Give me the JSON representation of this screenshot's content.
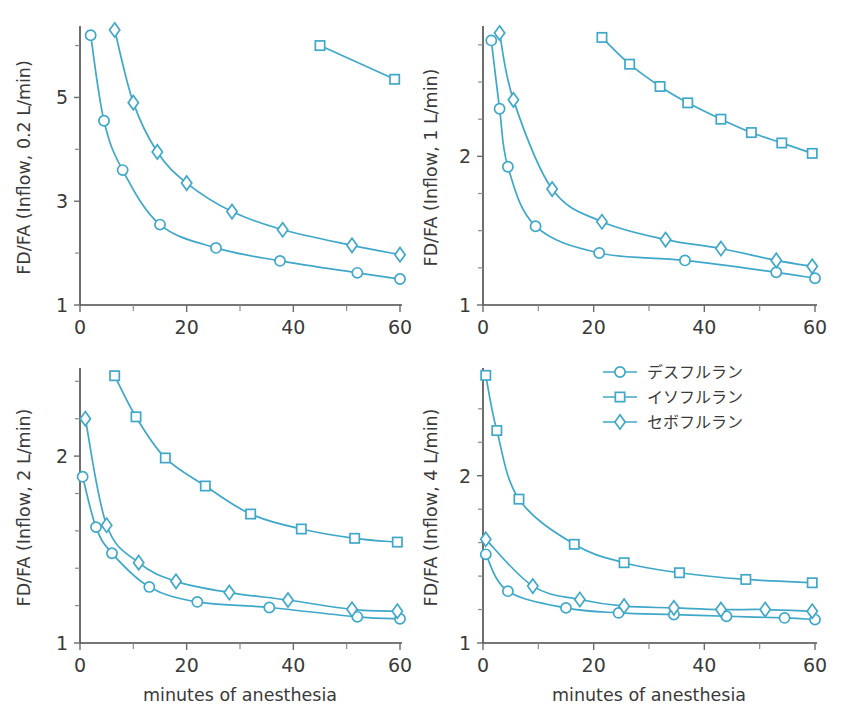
{
  "figure": {
    "accent_color": "#3fa8c9",
    "axis_color": "#4a4a4a",
    "xlabel": "minutes of anesthesia",
    "marker_shapes": {
      "desflurane": "circle",
      "isoflurane": "square",
      "sevoflurane": "diamond"
    }
  },
  "legend": {
    "position": "top-right of bottom-right panel",
    "entries": [
      {
        "label": "デスフルラン",
        "marker": "circle"
      },
      {
        "label": "イソフルラン",
        "marker": "square"
      },
      {
        "label": "セボフルラン",
        "marker": "diamond"
      }
    ]
  },
  "chart_data": [
    {
      "id": "panel-top-left",
      "type": "line",
      "title": "",
      "ylabel": "FD/FA  (Inflow, 0.2 L/min)",
      "xlabel": "",
      "xlim": [
        0,
        60
      ],
      "ylim": [
        1,
        6.3
      ],
      "xticks": [
        0,
        20,
        40,
        60
      ],
      "xticklabels": [
        "0",
        "20",
        "40",
        "60"
      ],
      "xminorticks": [
        10,
        30,
        50
      ],
      "yticks": [
        1,
        3,
        5
      ],
      "yticklabels": [
        "1",
        "3",
        "5"
      ],
      "yminorticks": [
        2,
        4,
        6
      ],
      "grid": false,
      "series": [
        {
          "name": "デスフルラン",
          "marker": "circle",
          "x": [
            2,
            4.5,
            8,
            15,
            25.5,
            37.5,
            52,
            60
          ],
          "y": [
            6.2,
            4.55,
            3.6,
            2.55,
            2.1,
            1.85,
            1.62,
            1.5
          ]
        },
        {
          "name": "イソフルラン",
          "marker": "square",
          "x": [
            45,
            59
          ],
          "y": [
            6.0,
            5.35
          ]
        },
        {
          "name": "セボフルラン",
          "marker": "diamond",
          "x": [
            6.5,
            10,
            14.5,
            20,
            28.5,
            38,
            51,
            60
          ],
          "y": [
            6.3,
            4.9,
            3.95,
            3.35,
            2.8,
            2.45,
            2.15,
            1.97
          ]
        }
      ]
    },
    {
      "id": "panel-top-right",
      "type": "line",
      "title": "",
      "ylabel": "FD/FA  (Inflow, 1 L/min)",
      "xlabel": "",
      "xlim": [
        0,
        60
      ],
      "ylim": [
        1,
        2.85
      ],
      "xticks": [
        0,
        20,
        40,
        60
      ],
      "xticklabels": [
        "0",
        "20",
        "40",
        "60"
      ],
      "xminorticks": [
        10,
        30,
        50
      ],
      "yticks": [
        1,
        2
      ],
      "yticklabels": [
        "1",
        "2"
      ],
      "yminorticks": [
        1.25,
        1.5,
        1.75,
        2.25,
        2.5,
        2.75
      ],
      "grid": false,
      "series": [
        {
          "name": "デスフルラン",
          "marker": "circle",
          "x": [
            1.5,
            3,
            4.5,
            9.5,
            21,
            36.5,
            53,
            60
          ],
          "y": [
            2.78,
            2.32,
            1.93,
            1.53,
            1.35,
            1.3,
            1.22,
            1.18
          ]
        },
        {
          "name": "イソフルラン",
          "marker": "square",
          "x": [
            21.5,
            26.5,
            32,
            37,
            43,
            48.5,
            54,
            59.5
          ],
          "y": [
            2.8,
            2.62,
            2.47,
            2.36,
            2.25,
            2.16,
            2.09,
            2.02
          ]
        },
        {
          "name": "セボフルラン",
          "marker": "diamond",
          "x": [
            3,
            5.5,
            12.5,
            21.5,
            33,
            43,
            53,
            59.5
          ],
          "y": [
            2.83,
            2.38,
            1.78,
            1.56,
            1.44,
            1.38,
            1.3,
            1.26
          ]
        }
      ]
    },
    {
      "id": "panel-bottom-left",
      "type": "line",
      "title": "",
      "ylabel": "FD/FA  (Inflow, 2 L/min)",
      "xlabel": "minutes of anesthesia",
      "xlim": [
        0,
        60
      ],
      "ylim": [
        1,
        2.45
      ],
      "xticks": [
        0,
        20,
        40,
        60
      ],
      "xticklabels": [
        "0",
        "20",
        "40",
        "60"
      ],
      "xminorticks": [
        10,
        30,
        50
      ],
      "yticks": [
        1,
        2
      ],
      "yticklabels": [
        "1",
        "2"
      ],
      "yminorticks": [
        1.2,
        1.4,
        1.6,
        1.8,
        2.2,
        2.4
      ],
      "grid": false,
      "series": [
        {
          "name": "デスフルラン",
          "marker": "circle",
          "x": [
            0.5,
            3,
            6,
            13,
            22,
            35.5,
            52,
            60
          ],
          "y": [
            1.89,
            1.62,
            1.48,
            1.3,
            1.22,
            1.19,
            1.14,
            1.13
          ]
        },
        {
          "name": "イソフルラン",
          "marker": "square",
          "x": [
            6.5,
            10.5,
            16,
            23.5,
            32,
            41.5,
            51.5,
            59.5
          ],
          "y": [
            2.43,
            2.21,
            1.99,
            1.84,
            1.69,
            1.61,
            1.56,
            1.54
          ]
        },
        {
          "name": "セボフルラン",
          "marker": "diamond",
          "x": [
            1,
            5,
            11,
            18,
            28,
            39,
            51,
            59.5
          ],
          "y": [
            2.2,
            1.63,
            1.43,
            1.33,
            1.27,
            1.23,
            1.18,
            1.17
          ]
        }
      ]
    },
    {
      "id": "panel-bottom-right",
      "type": "line",
      "title": "",
      "ylabel": "FD/FA  (Inflow, 4 L/min)",
      "xlabel": "minutes of anesthesia",
      "xlim": [
        0,
        60
      ],
      "ylim": [
        1,
        2.62
      ],
      "xticks": [
        0,
        20,
        40,
        60
      ],
      "xticklabels": [
        "0",
        "20",
        "40",
        "60"
      ],
      "xminorticks": [
        10,
        30,
        50
      ],
      "yticks": [
        1,
        2
      ],
      "yticklabels": [
        "1",
        "2"
      ],
      "yminorticks": [
        1.2,
        1.4,
        1.6,
        1.8,
        2.2,
        2.4
      ],
      "grid": false,
      "series": [
        {
          "name": "デスフルラン",
          "marker": "circle",
          "x": [
            0.5,
            4.5,
            15,
            24.5,
            34.5,
            44,
            54.5,
            60
          ],
          "y": [
            1.53,
            1.31,
            1.21,
            1.18,
            1.17,
            1.16,
            1.15,
            1.14
          ]
        },
        {
          "name": "イソフルラン",
          "marker": "square",
          "x": [
            0.5,
            2.5,
            6.5,
            16.5,
            25.5,
            35.5,
            47.5,
            59.5
          ],
          "y": [
            2.6,
            2.27,
            1.86,
            1.59,
            1.48,
            1.42,
            1.38,
            1.36
          ]
        },
        {
          "name": "セボフルラン",
          "marker": "diamond",
          "x": [
            0.5,
            9,
            17.5,
            25.5,
            34.5,
            43,
            51,
            59.5
          ],
          "y": [
            1.62,
            1.34,
            1.26,
            1.22,
            1.21,
            1.2,
            1.2,
            1.19
          ]
        }
      ]
    }
  ]
}
